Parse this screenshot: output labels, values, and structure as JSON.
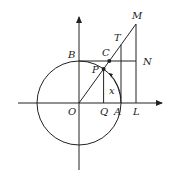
{
  "diagram": {
    "type": "unit circle trigonometric line diagram",
    "labels": {
      "O": "O",
      "A": "A",
      "B": "B",
      "C": "C",
      "P": "P",
      "Q": "Q",
      "T": "T",
      "M": "M",
      "N": "N",
      "L": "L",
      "angle": "x"
    },
    "colors": {
      "stroke": "#222222",
      "background": "#ffffff"
    }
  }
}
